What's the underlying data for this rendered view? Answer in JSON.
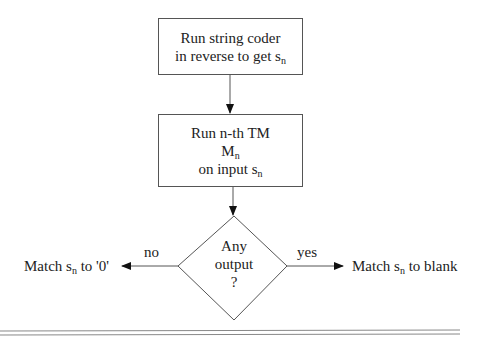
{
  "nodes": {
    "decode": {
      "line1": "Run string coder",
      "line2_prefix": "in reverse to get s",
      "line2_sub": "n"
    },
    "run_tm": {
      "line1": "Run n-th TM",
      "line2_prefix": "M",
      "line2_sub": "n",
      "line3_prefix": "on input s",
      "line3_sub": "n"
    },
    "decision": {
      "line1": "Any",
      "line2": "output",
      "line3": "?"
    },
    "no_result": {
      "prefix": "Match s",
      "sub": "n",
      "suffix": " to '0'"
    },
    "yes_result": {
      "prefix": "Match s",
      "sub": "n",
      "suffix": " to blank"
    }
  },
  "edges": {
    "no_label": "no",
    "yes_label": "yes"
  },
  "colors": {
    "stroke": "#555555",
    "text": "#222222",
    "rule": "#888888"
  }
}
